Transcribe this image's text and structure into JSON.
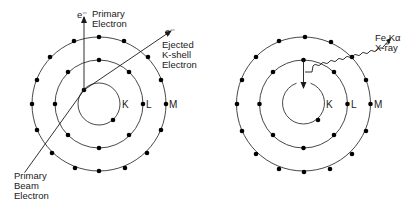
{
  "diagram": {
    "title": "",
    "panels": [
      {
        "id": "ionization",
        "shells": [
          "K",
          "L",
          "M"
        ],
        "labels": {
          "primary_electron_symbol": "e⁻",
          "primary_electron_line1": "Primary",
          "primary_electron_line2": "Electron",
          "ejected_symbol": "e⁻",
          "ejected_line1": "Ejected",
          "ejected_line2": "K-shell",
          "ejected_line3": "Electron",
          "beam_line1": "Primary",
          "beam_line2": "Beam",
          "beam_line3": "Electron"
        }
      },
      {
        "id": "relaxation",
        "shells": [
          "K",
          "L",
          "M"
        ],
        "labels": {
          "xray_line1": "Fe Kα",
          "xray_line2": "X-ray"
        }
      }
    ],
    "shell_labels": {
      "k": "K",
      "l": "L",
      "m": "M"
    },
    "colors": {
      "line": "#1a1a1a",
      "dot": "#000000",
      "background": "#ffffff"
    }
  }
}
